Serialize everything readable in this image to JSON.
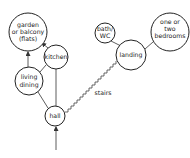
{
  "diagram": {
    "type": "house-circulation-bubble-diagram",
    "nodes": [
      {
        "id": "garden",
        "lines": [
          "garden",
          "or balcony",
          "(flats)"
        ],
        "cx": 28,
        "cy": 32,
        "r": 19
      },
      {
        "id": "kitchen",
        "lines": [
          "kitchen"
        ],
        "cx": 56,
        "cy": 57,
        "r": 12
      },
      {
        "id": "living",
        "lines": [
          "living",
          "dining"
        ],
        "cx": 29,
        "cy": 81,
        "r": 14
      },
      {
        "id": "hall",
        "lines": [
          "hall"
        ],
        "cx": 55,
        "cy": 116,
        "r": 10
      },
      {
        "id": "bath",
        "lines": [
          "bath/",
          "WC"
        ],
        "cx": 105,
        "cy": 33,
        "r": 10
      },
      {
        "id": "landing",
        "lines": [
          "landing"
        ],
        "cx": 131,
        "cy": 55,
        "r": 15
      },
      {
        "id": "bedrooms",
        "lines": [
          "one or",
          "two",
          "bedrooms"
        ],
        "cx": 170,
        "cy": 32,
        "r": 19
      }
    ],
    "edges": [
      {
        "from": "living",
        "to": "garden",
        "arrow": true
      },
      {
        "from": "kitchen",
        "to": "garden",
        "arrow": true
      },
      {
        "from": "living",
        "to": "kitchen",
        "arrow": false
      },
      {
        "from": "living",
        "to": "hall",
        "arrow": false
      },
      {
        "from": "kitchen",
        "to": "hall",
        "arrow": false
      },
      {
        "from": "bath",
        "to": "landing",
        "arrow": false
      },
      {
        "from": "landing",
        "to": "bedrooms",
        "arrow": false
      },
      {
        "from": "entrance",
        "to": "hall",
        "arrow": true
      }
    ],
    "stairs": {
      "label": "stairs",
      "from": "hall",
      "to": "landing"
    }
  }
}
